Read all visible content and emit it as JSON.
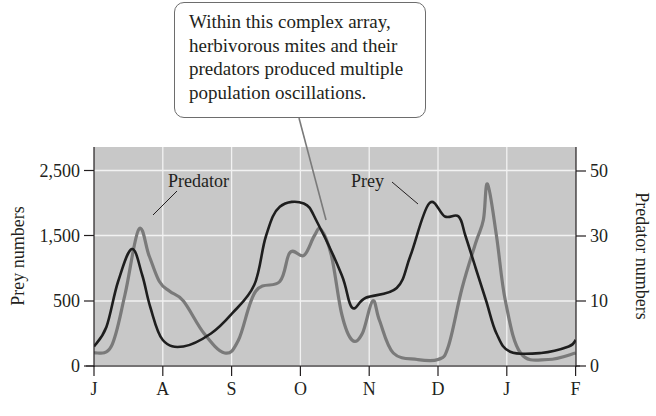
{
  "callout": {
    "lines": [
      "Within this complex array,",
      "herbivorous mites and their",
      "predators produced multiple",
      "population oscillations."
    ]
  },
  "colors": {
    "plot_background": "#c8c8c8",
    "grid": "#f2f2f2",
    "prey_line": "#1e1e1e",
    "predator_line": "#7a7a7a",
    "axis": "#231f20"
  },
  "chart_data": {
    "type": "line",
    "title": "",
    "xlabel": "",
    "ylabel": "Prey numbers",
    "ylabel_right": "Predator numbers",
    "x_ticks": [
      "J",
      "A",
      "S",
      "O",
      "N",
      "D",
      "J",
      "F"
    ],
    "y_ticks_left": [
      "0",
      "500",
      "1,500",
      "2,500"
    ],
    "y_ticks_right": [
      "0",
      "10",
      "30",
      "50"
    ],
    "grid": true,
    "annotations": [
      {
        "text": "Predator",
        "target": "predator peak in late July"
      },
      {
        "text": "Prey",
        "target": "prey peak in late November"
      },
      {
        "text": "Within this complex array, herbivorous mites and their predators produced multiple population oscillations.",
        "target": "predator peak in mid October"
      }
    ],
    "series": [
      {
        "name": "Prey",
        "axis": "left",
        "x_months": [
          0.0,
          0.18,
          0.35,
          0.55,
          0.7,
          0.82,
          1.0,
          1.3,
          1.7,
          2.0,
          2.33,
          2.5,
          2.7,
          3.05,
          3.25,
          3.6,
          3.75,
          3.95,
          4.4,
          4.6,
          4.87,
          5.1,
          5.3,
          5.4,
          5.55,
          5.7,
          5.85,
          6.05,
          6.5,
          6.9,
          7.0
        ],
        "values": [
          150,
          300,
          800,
          1300,
          900,
          450,
          200,
          150,
          250,
          400,
          750,
          1500,
          1950,
          2000,
          1700,
          900,
          450,
          550,
          700,
          1200,
          2000,
          1800,
          1800,
          1500,
          1000,
          500,
          250,
          110,
          100,
          150,
          200
        ]
      },
      {
        "name": "Predator",
        "axis": "right",
        "x_months": [
          0.0,
          0.25,
          0.45,
          0.65,
          0.8,
          0.95,
          1.1,
          1.3,
          1.6,
          1.9,
          2.1,
          2.35,
          2.7,
          2.85,
          3.05,
          3.2,
          3.3,
          3.45,
          3.6,
          3.75,
          3.9,
          4.05,
          4.15,
          4.35,
          4.7,
          5.0,
          5.15,
          5.35,
          5.55,
          5.66,
          5.72,
          5.85,
          5.98,
          6.2,
          6.6,
          7.0
        ],
        "values": [
          2,
          3,
          12,
          32,
          24,
          16,
          13,
          10,
          5,
          2,
          4,
          13,
          16,
          25,
          24,
          30,
          32,
          24,
          8,
          4,
          5,
          10,
          7,
          2,
          1,
          1,
          3,
          14,
          28,
          35,
          46,
          30,
          10,
          2,
          1,
          2
        ]
      }
    ]
  }
}
